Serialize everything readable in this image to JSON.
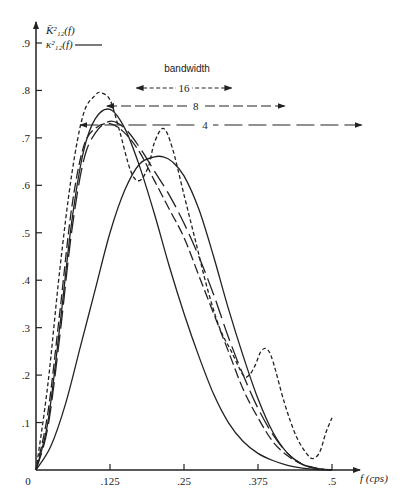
{
  "chart_data": {
    "type": "line",
    "title": "",
    "xlabel": "f (cps)",
    "ylabel": "",
    "xlim": [
      0,
      0.5
    ],
    "ylim": [
      0,
      0.9
    ],
    "x_ticks": [
      {
        "value": 0,
        "label": "0"
      },
      {
        "value": 0.125,
        "label": ".125"
      },
      {
        "value": 0.25,
        "label": ".25"
      },
      {
        "value": 0.375,
        "label": ".375"
      },
      {
        "value": 0.5,
        "label": ".5"
      }
    ],
    "y_ticks": [
      {
        "value": 0.1,
        "label": ".1"
      },
      {
        "value": 0.2,
        "label": ".2"
      },
      {
        "value": 0.3,
        "label": ".3"
      },
      {
        "value": 0.4,
        "label": ".4"
      },
      {
        "value": 0.5,
        "label": ".5"
      },
      {
        "value": 0.6,
        "label": ".6"
      },
      {
        "value": 0.7,
        "label": ".7"
      },
      {
        "value": 0.8,
        "label": ".8"
      },
      {
        "value": 0.9,
        "label": ".9"
      }
    ],
    "legend": {
      "position": "top-left",
      "entries": [
        {
          "label": "K̄²₁₂(f)",
          "style": "none"
        },
        {
          "label": "κ²₁₂(f)",
          "style": "solid"
        }
      ]
    },
    "bandwidth_annotation": {
      "title": "bandwidth",
      "items": [
        {
          "label": "16",
          "style": "short-dash",
          "x_range": [
            0.17,
            0.33
          ]
        },
        {
          "label": "8",
          "style": "long-dash",
          "x_range": [
            0.12,
            0.42
          ]
        },
        {
          "label": "4",
          "style": "very-long-dash",
          "x_range": [
            0.075,
            0.55
          ]
        }
      ]
    },
    "series": [
      {
        "name": "bandwidth 16",
        "style": "short-dash",
        "x": [
          0,
          0.02,
          0.04,
          0.06,
          0.08,
          0.1,
          0.11,
          0.125,
          0.14,
          0.16,
          0.175,
          0.19,
          0.2,
          0.215,
          0.23,
          0.25,
          0.27,
          0.29,
          0.31,
          0.33,
          0.35,
          0.36,
          0.37,
          0.38,
          0.39,
          0.4,
          0.42,
          0.44,
          0.46,
          0.47,
          0.48,
          0.49,
          0.5
        ],
        "y": [
          0,
          0.18,
          0.42,
          0.62,
          0.75,
          0.79,
          0.795,
          0.78,
          0.72,
          0.63,
          0.61,
          0.64,
          0.69,
          0.72,
          0.68,
          0.58,
          0.48,
          0.38,
          0.3,
          0.25,
          0.2,
          0.2,
          0.22,
          0.25,
          0.255,
          0.23,
          0.14,
          0.07,
          0.03,
          0.025,
          0.04,
          0.08,
          0.11
        ]
      },
      {
        "name": "bandwidth 8",
        "style": "long-dash",
        "x": [
          0,
          0.02,
          0.04,
          0.06,
          0.08,
          0.1,
          0.125,
          0.15,
          0.175,
          0.2,
          0.225,
          0.25,
          0.275,
          0.3,
          0.325,
          0.35,
          0.375,
          0.4,
          0.425,
          0.45,
          0.475,
          0.5
        ],
        "y": [
          0,
          0.12,
          0.33,
          0.55,
          0.68,
          0.72,
          0.73,
          0.71,
          0.67,
          0.61,
          0.55,
          0.49,
          0.41,
          0.33,
          0.25,
          0.17,
          0.11,
          0.06,
          0.03,
          0.012,
          0.004,
          0
        ]
      },
      {
        "name": "κ²₁₂(f) (true, narrow)",
        "style": "solid",
        "x": [
          0,
          0.02,
          0.04,
          0.06,
          0.08,
          0.1,
          0.125,
          0.15,
          0.175,
          0.2,
          0.225,
          0.25,
          0.275,
          0.3,
          0.325,
          0.35,
          0.375,
          0.4,
          0.425,
          0.45,
          0.475,
          0.5
        ],
        "y": [
          0,
          0.1,
          0.3,
          0.52,
          0.67,
          0.74,
          0.76,
          0.72,
          0.64,
          0.54,
          0.43,
          0.33,
          0.24,
          0.16,
          0.1,
          0.06,
          0.035,
          0.02,
          0.01,
          0.004,
          0.001,
          0
        ]
      },
      {
        "name": "bandwidth 4",
        "style": "very-long-dash",
        "x": [
          0,
          0.02,
          0.04,
          0.06,
          0.08,
          0.1,
          0.125,
          0.15,
          0.175,
          0.2,
          0.225,
          0.25,
          0.275,
          0.3,
          0.325,
          0.35,
          0.375,
          0.4,
          0.425,
          0.45,
          0.475,
          0.5
        ],
        "y": [
          0,
          0.09,
          0.28,
          0.5,
          0.65,
          0.71,
          0.735,
          0.72,
          0.68,
          0.63,
          0.58,
          0.52,
          0.45,
          0.37,
          0.28,
          0.2,
          0.13,
          0.075,
          0.035,
          0.012,
          0.003,
          0
        ]
      },
      {
        "name": "κ²₁₂(f) (true, shifted)",
        "style": "solid",
        "x": [
          0,
          0.025,
          0.05,
          0.075,
          0.1,
          0.125,
          0.15,
          0.175,
          0.2,
          0.215,
          0.23,
          0.25,
          0.275,
          0.3,
          0.325,
          0.35,
          0.375,
          0.4,
          0.425,
          0.45,
          0.475,
          0.5
        ],
        "y": [
          0,
          0.05,
          0.14,
          0.26,
          0.38,
          0.5,
          0.59,
          0.645,
          0.66,
          0.66,
          0.65,
          0.62,
          0.55,
          0.45,
          0.34,
          0.24,
          0.15,
          0.08,
          0.035,
          0.012,
          0.003,
          0
        ]
      }
    ]
  }
}
